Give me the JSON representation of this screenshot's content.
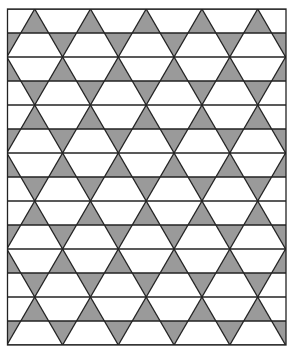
{
  "figure": {
    "type": "trihexagonal-tiling",
    "frame": {
      "x": 7.5,
      "y": 9,
      "width": 278.5,
      "height": 336
    },
    "strip_height": 24,
    "strip_count": 14,
    "vertex_spacing": 55.75,
    "first_vertex_x_even_rows": 34.7,
    "first_vertex_x_odd_rows": 6.825,
    "colors": {
      "background": "#ffffff",
      "triangle_fill": "#9a9a9a",
      "line": "#222222"
    },
    "line_width": 1.3
  }
}
